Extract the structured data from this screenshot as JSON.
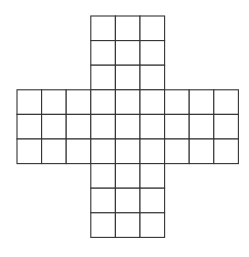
{
  "diagram": {
    "type": "cross-shaped grid (net)",
    "cell_size": 24.6,
    "origin": [
      17,
      16
    ],
    "line_color": "#333333",
    "background": "#ffffff",
    "grid_columns": 9,
    "grid_rows": 9,
    "blocks": [
      {
        "name": "top-arm",
        "col": 3,
        "row": 0,
        "cols": 3,
        "rows": 3
      },
      {
        "name": "middle-band",
        "col": 0,
        "row": 3,
        "cols": 9,
        "rows": 3
      },
      {
        "name": "bottom-arm",
        "col": 3,
        "row": 6,
        "cols": 3,
        "rows": 3
      }
    ]
  }
}
